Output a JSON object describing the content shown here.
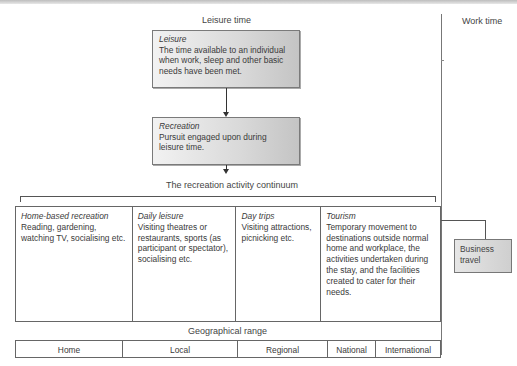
{
  "headers": {
    "leisure_time": "Leisure time",
    "work_time": "Work time"
  },
  "boxes": {
    "leisure": {
      "title": "Leisure",
      "text": "The time available to an individual when work, sleep and other basic needs have been met."
    },
    "recreation": {
      "title": "Recreation",
      "text": "Pursuit engaged upon during leisure time."
    }
  },
  "continuum_label": "The recreation activity continuum",
  "activities": [
    {
      "title": "Home-based recreation",
      "text": "Reading, gardening, watching TV, socialising etc."
    },
    {
      "title": "Daily leisure",
      "text": "Visiting theatres or restaurants, sports (as participant or spectator), socialising etc."
    },
    {
      "title": "Day trips",
      "text": "Visiting attractions, picnicking etc."
    },
    {
      "title": "Tourism",
      "text": "Temporary movement to destinations outside normal home and workplace, the activities undertaken during the stay, and the facilities created to cater for their needs."
    }
  ],
  "business_travel": "Business travel",
  "geographical_range_label": "Geographical range",
  "geographical_range": [
    "Home",
    "Local",
    "Regional",
    "National",
    "International"
  ],
  "colors": {
    "box_gradient_start": "#f2f2f2",
    "box_gradient_end": "#c4c4c4",
    "line": "#555555"
  }
}
